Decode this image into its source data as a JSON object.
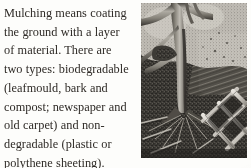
{
  "page": {
    "background_color": "#fdfdfb",
    "ink_color": "#2e2a26"
  },
  "body_text": {
    "full_text": "Mulching means coating the ground with a layer of material. There are two types: biodegradable (leafmould, bark and compost; newspaper and old carpet) and non-degradable (plastic or polythene sheeting). Both help to discourage",
    "lines": [
      "Mulching means coating",
      "the ground with a layer",
      "of material. There are",
      "two types: biodegradable",
      "(leafmould, bark and",
      "compost; newspaper and",
      "old carpet) and non-",
      "degradable (plastic or",
      "polythene sheeting).",
      "Both help to discourage"
    ]
  },
  "illustration": {
    "caption": "",
    "description": "Monochrome engraved illustration: a tree trunk with forked branches rising from mulched ground, with a diamond-lattice trellis at lower right",
    "style": "grayscale engraving / halftone scan",
    "palette": {
      "ground_dark": "#2b2825",
      "ground_mid": "#5d5a54",
      "sky_light": "#d8d5cf",
      "bark_light": "#bdb9b2",
      "bark_mid": "#78746d",
      "bark_dark": "#3a3733",
      "trellis": "#e6e3dd"
    }
  }
}
